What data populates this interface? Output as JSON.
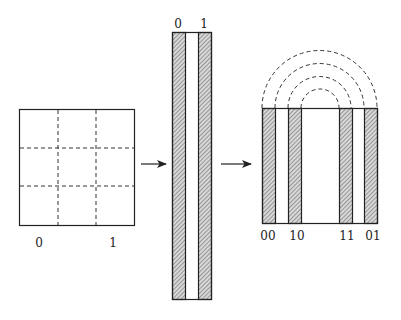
{
  "diagram": {
    "left_square": {
      "labels": [
        {
          "text": "0",
          "x": 39,
          "y": 247
        },
        {
          "text": "1",
          "x": 113,
          "y": 247
        }
      ],
      "grid": {
        "rows": 3,
        "cols": 3
      }
    },
    "middle_strip": {
      "labels": [
        {
          "text": "0",
          "x": 178,
          "y": 28
        },
        {
          "text": "1",
          "x": 204,
          "y": 28
        }
      ]
    },
    "right_rect": {
      "labels": [
        {
          "text": "00",
          "x": 268,
          "y": 240
        },
        {
          "text": "10",
          "x": 295,
          "y": 240
        },
        {
          "text": "11",
          "x": 346,
          "y": 240
        },
        {
          "text": "01",
          "x": 371,
          "y": 240
        }
      ],
      "arcs": 4
    },
    "arrows": 2,
    "colors": {
      "stroke": "#222222",
      "hatch": "#555555",
      "hatch_bg": "#d8d8d8"
    }
  }
}
